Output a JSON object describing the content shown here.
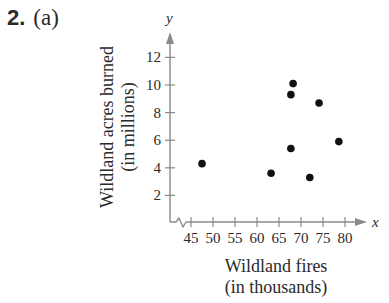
{
  "problem": {
    "number": "2.",
    "part": "(a)"
  },
  "colors": {
    "axis": "#8a8a8a",
    "point": "#111111",
    "text": "#2a2a2a"
  },
  "chart_data": {
    "type": "scatter",
    "title": "",
    "xlabel": "Wildland fires (in thousands)",
    "xlabel_lines": [
      "Wildland fires",
      "(in thousands)"
    ],
    "ylabel": "Wildland acres burned (in millions)",
    "ylabel_lines": [
      "Wildland acres burned",
      "(in millions)"
    ],
    "x_axis_name": "x",
    "y_axis_name": "y",
    "x_ticks": [
      45,
      50,
      55,
      60,
      65,
      70,
      75,
      80
    ],
    "y_ticks": [
      2,
      4,
      6,
      8,
      10,
      12
    ],
    "xlim": [
      40,
      83
    ],
    "ylim": [
      0,
      13.5
    ],
    "x_axis_break": true,
    "grid": false,
    "legend": null,
    "points": [
      {
        "x": 47.5,
        "y": 4.3
      },
      {
        "x": 63.2,
        "y": 3.6
      },
      {
        "x": 67.7,
        "y": 5.4
      },
      {
        "x": 67.7,
        "y": 9.3
      },
      {
        "x": 68.2,
        "y": 10.1
      },
      {
        "x": 72.0,
        "y": 3.3
      },
      {
        "x": 74.1,
        "y": 8.7
      },
      {
        "x": 78.6,
        "y": 5.9
      }
    ]
  }
}
